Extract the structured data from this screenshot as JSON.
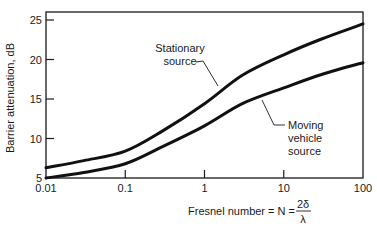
{
  "chart_data": {
    "type": "line",
    "title": "",
    "xlabel": "Fresnel number = N = 2δ/λ",
    "xlabel_parts": {
      "prefix": "Fresnel number = N = ",
      "numerator": "2δ",
      "denominator": "λ"
    },
    "ylabel": "Barrier attenuation, dB",
    "xscale": "log",
    "xlim": [
      0.01,
      100
    ],
    "ylim": [
      5,
      26
    ],
    "x_ticks": [
      0.01,
      0.1,
      1,
      10,
      100
    ],
    "x_tick_labels": [
      "0.01",
      "0.1",
      "1",
      "10",
      "100"
    ],
    "y_ticks": [
      5,
      10,
      15,
      20,
      25
    ],
    "y_tick_labels": [
      "5",
      "10",
      "15",
      "20",
      "25"
    ],
    "grid": false,
    "legend": "none (inline annotations with leader lines)",
    "x": [
      0.01,
      0.03,
      0.1,
      0.3,
      1,
      3,
      10,
      30,
      100
    ],
    "series": [
      {
        "name": "Stationary source",
        "values": [
          6.3,
          7.2,
          8.4,
          11.0,
          14.4,
          18.0,
          20.6,
          22.6,
          24.5
        ]
      },
      {
        "name": "Moving vehicle source",
        "values": [
          5.0,
          5.7,
          6.8,
          9.0,
          11.6,
          14.4,
          16.4,
          18.1,
          19.6
        ]
      }
    ],
    "annotations": [
      {
        "lines": [
          "Stationary",
          "source"
        ],
        "points_to": "Stationary source"
      },
      {
        "lines": [
          "Moving",
          "vehicle",
          "source"
        ],
        "points_to": "Moving vehicle source"
      }
    ]
  },
  "colors": {
    "line": "#111111",
    "axis": "#1a1a1a",
    "background": "#ffffff"
  }
}
